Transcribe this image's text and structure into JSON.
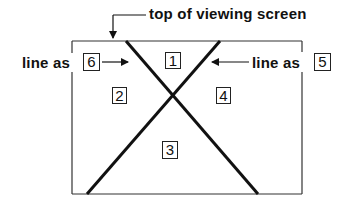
{
  "diagram": {
    "title_label": "top of viewing screen",
    "left_label": {
      "text": "line as",
      "box": "6"
    },
    "right_label": {
      "text": "line as",
      "box": "5"
    },
    "regions": [
      {
        "id": "1",
        "position": "top"
      },
      {
        "id": "2",
        "position": "left"
      },
      {
        "id": "3",
        "position": "bottom"
      },
      {
        "id": "4",
        "position": "right"
      }
    ],
    "colors": {
      "line": "#111111",
      "frame": "#333333",
      "background": "#ffffff"
    }
  }
}
